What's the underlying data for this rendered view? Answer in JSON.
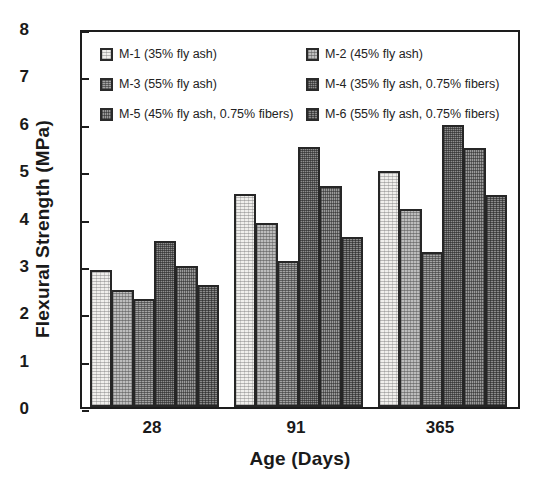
{
  "chart_data": {
    "type": "bar",
    "title": "",
    "xlabel": "Age (Days)",
    "ylabel": "Flexural Strength (MPa)",
    "categories": [
      "28",
      "91",
      "365"
    ],
    "ylim": [
      0,
      8
    ],
    "yticks": [
      "0",
      "1",
      "2",
      "3",
      "4",
      "5",
      "6",
      "7",
      "8"
    ],
    "grid": false,
    "legend_position": "inside-top",
    "series": [
      {
        "name": "M-1 (35% fly ash)",
        "values": [
          2.9,
          4.5,
          4.98
        ]
      },
      {
        "name": "M-2 (45% fly ash)",
        "values": [
          2.48,
          3.88,
          4.17
        ]
      },
      {
        "name": "M-3 (55% fly ash)",
        "values": [
          2.28,
          3.08,
          3.28
        ]
      },
      {
        "name": "M-4 (35% fly ash, 0.75% fibers)",
        "values": [
          3.5,
          5.48,
          5.95
        ]
      },
      {
        "name": "M-5 (45% fly ash, 0.75% fibers)",
        "values": [
          2.98,
          4.67,
          5.47
        ]
      },
      {
        "name": "M-6 (55% fly ash, 0.75% fibers)",
        "values": [
          2.58,
          3.58,
          4.47
        ]
      }
    ]
  },
  "legend": {
    "items": [
      {
        "label": "M-1 (35% fly ash)",
        "swatch": "pattern-1"
      },
      {
        "label": "M-2 (45% fly ash)",
        "swatch": "pattern-2"
      },
      {
        "label": "M-3 (55% fly ash)",
        "swatch": "pattern-3"
      },
      {
        "label": "M-4 (35% fly ash, 0.75% fibers)",
        "swatch": "pattern-4"
      },
      {
        "label": "M-5 (45% fly ash, 0.75% fibers)",
        "swatch": "pattern-5"
      },
      {
        "label": "M-6 (55% fly ash, 0.75% fibers)",
        "swatch": "pattern-6"
      }
    ]
  },
  "colors": {
    "axis": "#1d1d1d",
    "text": "#1a1a1a",
    "background": "#ffffff"
  }
}
